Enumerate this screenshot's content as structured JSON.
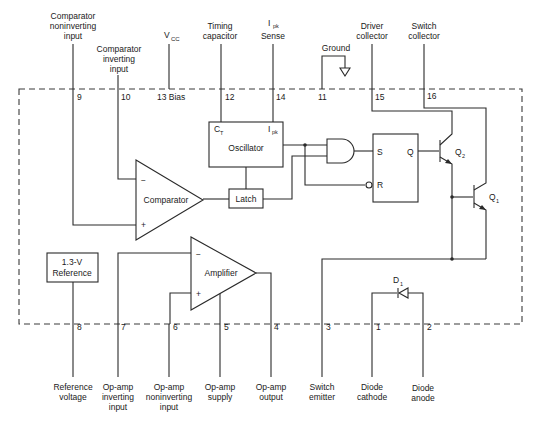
{
  "diagram": {
    "top_pins": [
      {
        "number": "9",
        "label_lines": [
          "Comparator",
          "noninverting",
          "input"
        ]
      },
      {
        "number": "10",
        "label_lines": [
          "Comparator",
          "inverting",
          "input"
        ]
      },
      {
        "number": "13 Bias",
        "label_lines": [
          "V",
          "CC"
        ]
      },
      {
        "number": "12",
        "label_lines": [
          "Timing",
          "capacitor"
        ]
      },
      {
        "number": "14",
        "label_lines": [
          "I",
          "pk",
          "Sense"
        ]
      },
      {
        "number": "11",
        "label_lines": [
          "Ground"
        ]
      },
      {
        "number": "15",
        "label_lines": [
          "Driver",
          "collector"
        ]
      },
      {
        "number": "16",
        "label_lines": [
          "Switch",
          "collector"
        ]
      }
    ],
    "bottom_pins": [
      {
        "number": "8",
        "label_lines": [
          "Reference",
          "voltage"
        ]
      },
      {
        "number": "7",
        "label_lines": [
          "Op-amp",
          "inverting",
          "input"
        ]
      },
      {
        "number": "6",
        "label_lines": [
          "Op-amp",
          "noninverting",
          "input"
        ]
      },
      {
        "number": "5",
        "label_lines": [
          "Op-amp",
          "supply"
        ]
      },
      {
        "number": "4",
        "label_lines": [
          "Op-amp",
          "output"
        ]
      },
      {
        "number": "3",
        "label_lines": [
          "Switch",
          "emitter"
        ]
      },
      {
        "number": "1",
        "label_lines": [
          "Diode",
          "cathode"
        ]
      },
      {
        "number": "2",
        "label_lines": [
          "Diode",
          "anode"
        ]
      }
    ],
    "blocks": {
      "oscillator": {
        "label": "Oscillator",
        "ct": "C",
        "ct_sub": "T",
        "ipk": "I",
        "ipk_sub": "pk"
      },
      "comparator": {
        "label": "Comparator",
        "minus": "−",
        "plus": "+"
      },
      "latch": {
        "label": "Latch"
      },
      "amplifier": {
        "label": "Amplifier",
        "minus": "−",
        "plus": "+"
      },
      "reference": {
        "label_lines": [
          "1.3-V",
          "Reference"
        ]
      },
      "flipflop": {
        "s": "S",
        "r": "R",
        "q": "Q"
      },
      "q2": {
        "label": "Q",
        "sub": "2"
      },
      "q1": {
        "label": "Q",
        "sub": "1"
      },
      "d1": {
        "label": "D",
        "sub": "1"
      }
    },
    "colors": {
      "line": "#2a2a2a",
      "text": "#1a1a1a",
      "background": "#ffffff"
    }
  }
}
